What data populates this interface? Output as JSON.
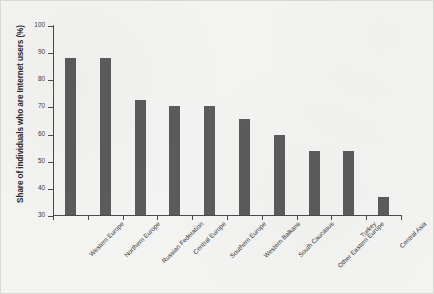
{
  "chart_data": {
    "type": "bar",
    "title": "",
    "xlabel": "",
    "ylabel": "Share of individuals who are Internet users (%)",
    "ylim": [
      30,
      100
    ],
    "yticks": [
      30,
      40,
      50,
      60,
      70,
      80,
      90,
      100
    ],
    "grid": false,
    "legend": null,
    "bar_color": "#5b5b5b",
    "background_color": "#f3f3f1",
    "axis_color": "#4a4a4a",
    "categories": [
      "Western Europe",
      "Northern Europe",
      "Russian Federation",
      "Central Europe",
      "Southern Europe",
      "Western Balkans",
      "South Caucasus",
      "Other Eastern Europe",
      "Turkey",
      "Central Asia"
    ],
    "values": [
      88,
      88,
      72.5,
      70,
      70,
      65.5,
      59.5,
      53.5,
      53.5,
      36.5
    ]
  }
}
